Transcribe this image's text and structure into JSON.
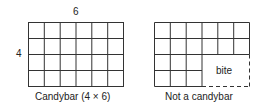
{
  "left": {
    "top_label": "6",
    "side_label": "4",
    "caption": "Candybar (4 × 6)",
    "rows": 4,
    "cols": 6
  },
  "right": {
    "caption": "Not a candybar",
    "bite_label": "bite",
    "rows": 4,
    "cols": 6,
    "bite": {
      "start_col": 3,
      "start_row": 2
    }
  },
  "colors": {
    "line": "#333333",
    "background": "#ffffff"
  }
}
